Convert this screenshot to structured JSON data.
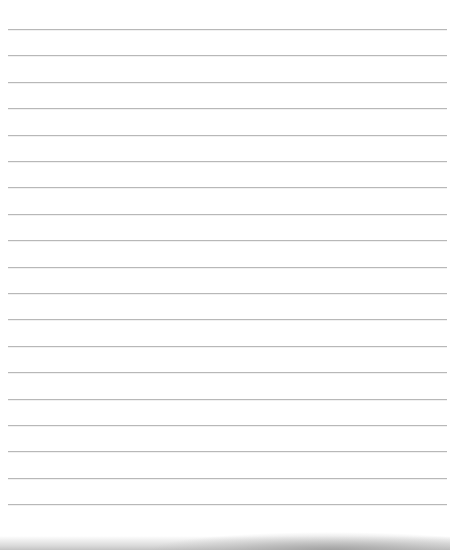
{
  "paper": {
    "type": "lined-notebook-page",
    "line_count": 19,
    "first_line_y": 29,
    "line_spacing": 26.4,
    "line_left": 8,
    "line_right": 447,
    "line_color": "#b8b8b8",
    "background_color": "#ffffff",
    "bottom_shadow_color": "#a8a8a8"
  }
}
